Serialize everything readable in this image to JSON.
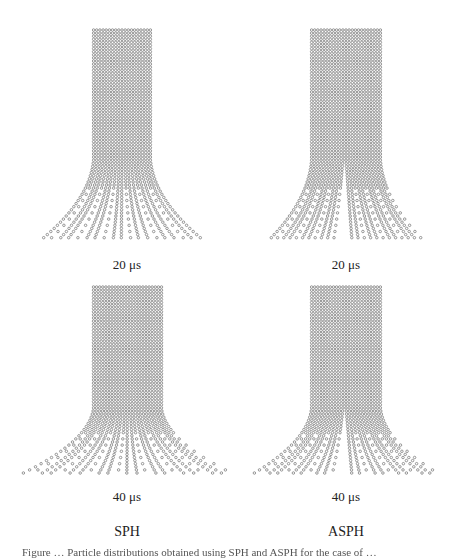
{
  "figure": {
    "panels": [
      {
        "id": "sph-20",
        "method": "SPH",
        "time_label": "20 μs",
        "column": {
          "x": 92,
          "y": 30,
          "w": 60,
          "h": 130
        },
        "fan": {
          "bottom_y": 242,
          "left_x": 48,
          "right_x": 205
        },
        "split": "spread"
      },
      {
        "id": "asph-20",
        "method": "ASPH",
        "time_label": "20 μs",
        "column": {
          "x": 310,
          "y": 30,
          "w": 72,
          "h": 130
        },
        "fan": {
          "bottom_y": 242,
          "left_x": 272,
          "right_x": 422
        },
        "split": "center"
      },
      {
        "id": "sph-40",
        "method": "SPH",
        "time_label": "40 μs",
        "column": {
          "x": 92,
          "y": 287,
          "w": 71,
          "h": 120
        },
        "fan": {
          "bottom_y": 475,
          "left_x": 20,
          "right_x": 235
        },
        "split": "spread"
      },
      {
        "id": "asph-40",
        "method": "ASPH",
        "time_label": "40 μs",
        "column": {
          "x": 310,
          "y": 287,
          "w": 72,
          "h": 120
        },
        "fan": {
          "bottom_y": 475,
          "left_x": 255,
          "right_x": 445
        },
        "split": "center"
      }
    ],
    "time_labels": {
      "top_left": "20 μs",
      "top_right": "20 μs",
      "bottom_left": "40 μs",
      "bottom_right": "40 μs"
    },
    "method_labels": {
      "left": "SPH",
      "right": "ASPH"
    },
    "caption_partial": "Figure … Particle distributions obtained using SPH and ASPH for the case of …",
    "colors": {
      "particle": "#8a8a8a",
      "background": "#ffffff",
      "text": "#222222"
    }
  }
}
